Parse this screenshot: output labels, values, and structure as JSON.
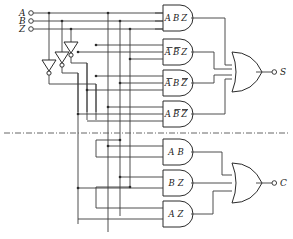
{
  "diagram": {
    "line_color": "#3a3a3a",
    "gate_stroke": "#2b2b2b",
    "background": "#ffffff"
  },
  "inputs": [
    {
      "label": "A",
      "terminal": "input-terminal-a"
    },
    {
      "label": "B",
      "terminal": "input-terminal-b"
    },
    {
      "label": "Z",
      "terminal": "input-terminal-z"
    }
  ],
  "inverters": [
    {
      "name": "inverter-z",
      "input": "Z",
      "output": "Z-bar"
    },
    {
      "name": "inverter-b",
      "input": "B",
      "output": "B-bar"
    },
    {
      "name": "inverter-a",
      "input": "A",
      "output": "A-bar"
    }
  ],
  "sum_section": {
    "output": {
      "label": "S",
      "terminal": "output-terminal-s"
    },
    "or_gate": {
      "name": "or-gate-sum",
      "inputs": 4
    },
    "and_gates": [
      {
        "name": "and-gate-abz",
        "text": "A B Z",
        "terms": [
          {
            "v": "A",
            "bar": false
          },
          {
            "v": "B",
            "bar": false
          },
          {
            "v": "Z",
            "bar": false
          }
        ]
      },
      {
        "name": "and-gate-nanbz",
        "text": "A B Z",
        "terms": [
          {
            "v": "A",
            "bar": true
          },
          {
            "v": "B",
            "bar": true
          },
          {
            "v": "Z",
            "bar": false
          }
        ]
      },
      {
        "name": "and-gate-nabnz",
        "text": "A B Z",
        "terms": [
          {
            "v": "A",
            "bar": true
          },
          {
            "v": "B",
            "bar": false
          },
          {
            "v": "Z",
            "bar": true
          }
        ]
      },
      {
        "name": "and-gate-anbnz",
        "text": "A B Z",
        "terms": [
          {
            "v": "A",
            "bar": false
          },
          {
            "v": "B",
            "bar": true
          },
          {
            "v": "Z",
            "bar": true
          }
        ]
      }
    ]
  },
  "carry_section": {
    "output": {
      "label": "C",
      "terminal": "output-terminal-c"
    },
    "or_gate": {
      "name": "or-gate-carry",
      "inputs": 3
    },
    "and_gates": [
      {
        "name": "and-gate-ab",
        "text": "A B",
        "terms": [
          {
            "v": "A",
            "bar": false
          },
          {
            "v": "B",
            "bar": false
          }
        ]
      },
      {
        "name": "and-gate-bz",
        "text": "B Z",
        "terms": [
          {
            "v": "B",
            "bar": false
          },
          {
            "v": "Z",
            "bar": false
          }
        ]
      },
      {
        "name": "and-gate-az",
        "text": "A Z",
        "terms": [
          {
            "v": "A",
            "bar": false
          },
          {
            "v": "Z",
            "bar": false
          }
        ]
      }
    ]
  },
  "divider": {
    "name": "section-divider",
    "style": "dash-dot"
  }
}
